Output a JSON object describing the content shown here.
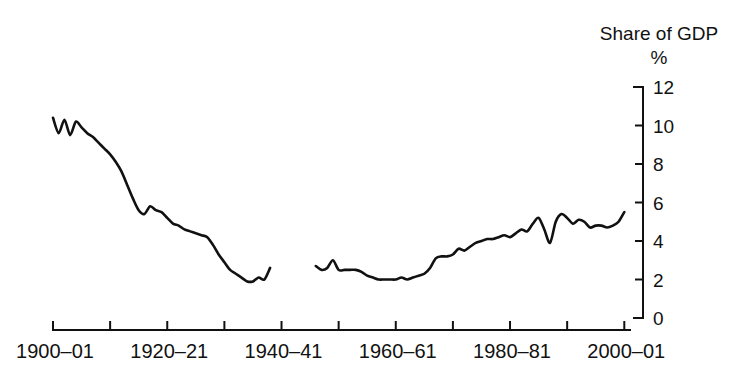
{
  "chart_data": {
    "type": "line",
    "title": "Share of GDP",
    "subtitle": "%",
    "xlabel": "",
    "ylabel": "Share of GDP %",
    "ylim": [
      0,
      12
    ],
    "y_ticks": [
      0,
      2,
      4,
      6,
      8,
      10,
      12
    ],
    "y_axis_position": "right",
    "grid": false,
    "legend": null,
    "x_tick_labels": [
      "1900–01",
      "1920–21",
      "1940–41",
      "1960–61",
      "1980–81",
      "2000–01"
    ],
    "x_tick_values": [
      1900,
      1920,
      1940,
      1960,
      1980,
      2000
    ],
    "x_minor_tick_values": [
      1910,
      1930,
      1950,
      1970,
      1990
    ],
    "xlim": [
      1900,
      2001
    ],
    "gap_note": "Data break between 1938–39 and 1946–47 (war years not plotted)",
    "series": [
      {
        "name": "Share of GDP",
        "segments": [
          {
            "name": "1900-01 to 1938-39",
            "x": [
              1900,
              1901,
              1902,
              1903,
              1904,
              1905,
              1906,
              1907,
              1908,
              1909,
              1910,
              1911,
              1912,
              1913,
              1914,
              1915,
              1916,
              1917,
              1918,
              1919,
              1920,
              1921,
              1922,
              1923,
              1924,
              1925,
              1926,
              1927,
              1928,
              1929,
              1930,
              1931,
              1932,
              1933,
              1934,
              1935,
              1936,
              1937,
              1938
            ],
            "y": [
              10.4,
              9.6,
              10.3,
              9.5,
              10.2,
              9.9,
              9.6,
              9.4,
              9.1,
              8.8,
              8.5,
              8.1,
              7.6,
              6.9,
              6.2,
              5.6,
              5.4,
              5.8,
              5.6,
              5.5,
              5.2,
              4.9,
              4.8,
              4.6,
              4.5,
              4.4,
              4.3,
              4.2,
              3.8,
              3.3,
              2.9,
              2.5,
              2.3,
              2.1,
              1.9,
              1.9,
              2.1,
              2.0,
              2.6
            ]
          },
          {
            "name": "1946-47 to 2000-01",
            "x": [
              1946,
              1947,
              1948,
              1949,
              1950,
              1951,
              1952,
              1953,
              1954,
              1955,
              1956,
              1957,
              1958,
              1959,
              1960,
              1961,
              1962,
              1963,
              1964,
              1965,
              1966,
              1967,
              1968,
              1969,
              1970,
              1971,
              1972,
              1973,
              1974,
              1975,
              1976,
              1977,
              1978,
              1979,
              1980,
              1981,
              1982,
              1983,
              1984,
              1985,
              1986,
              1987,
              1988,
              1989,
              1990,
              1991,
              1992,
              1993,
              1994,
              1995,
              1996,
              1997,
              1998,
              1999,
              2000
            ],
            "y": [
              2.7,
              2.5,
              2.6,
              3.0,
              2.5,
              2.5,
              2.5,
              2.5,
              2.4,
              2.2,
              2.1,
              2.0,
              2.0,
              2.0,
              2.0,
              2.1,
              2.0,
              2.1,
              2.2,
              2.3,
              2.6,
              3.1,
              3.2,
              3.2,
              3.3,
              3.6,
              3.5,
              3.7,
              3.9,
              4.0,
              4.1,
              4.1,
              4.2,
              4.3,
              4.2,
              4.4,
              4.6,
              4.5,
              4.9,
              5.2,
              4.6,
              3.9,
              5.0,
              5.4,
              5.2,
              4.9,
              5.1,
              5.0,
              4.7,
              4.8,
              4.8,
              4.7,
              4.8,
              5.0,
              5.5
            ]
          }
        ]
      }
    ]
  },
  "labels": {
    "title_line1": "Share of GDP",
    "title_line2": "%"
  }
}
